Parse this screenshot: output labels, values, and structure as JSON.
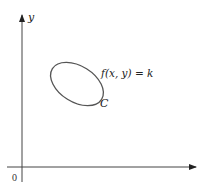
{
  "diagram": {
    "type": "level-curve",
    "axes": {
      "y_label": "y",
      "origin_label": "0"
    },
    "curve": {
      "equation_label": "f(x, y) = k",
      "name_label": "C"
    },
    "colors": {
      "axis": "#333333",
      "curve": "#555555",
      "text": "#222222",
      "background": "#ffffff"
    }
  }
}
